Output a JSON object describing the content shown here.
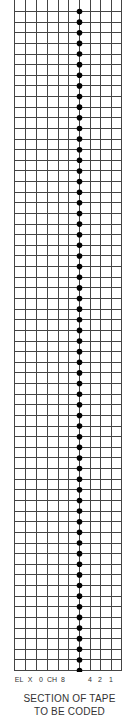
{
  "diagram": {
    "grid": {
      "left": 14,
      "right": 121,
      "top": 0,
      "bottom": 670,
      "column_x": [
        14,
        25,
        36,
        47,
        58,
        68,
        79,
        90,
        100,
        111,
        121
      ],
      "row_start": 11,
      "row_spacing": 10.63,
      "row_count": 63,
      "line_color": "#444444"
    },
    "feed_holes": {
      "x": 79,
      "radius": 2.8,
      "color": "#000000",
      "count": 63
    },
    "channel_labels": [
      {
        "text": "EL",
        "x": 19
      },
      {
        "text": "X",
        "x": 30
      },
      {
        "text": "0",
        "x": 41
      },
      {
        "text": "CH",
        "x": 52
      },
      {
        "text": "8",
        "x": 63
      },
      {
        "text": "4",
        "x": 90
      },
      {
        "text": "2",
        "x": 100
      },
      {
        "text": "1",
        "x": 111
      }
    ],
    "caption_line1": "SECTION OF TAPE",
    "caption_line2": "TO BE CODED"
  }
}
